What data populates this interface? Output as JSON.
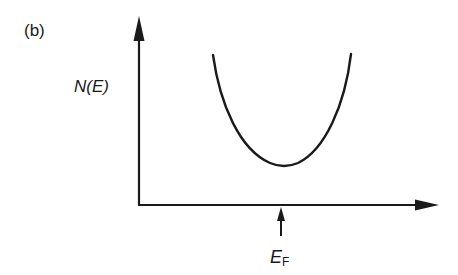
{
  "diagram": {
    "panel_label": "(b)",
    "y_axis_label": "N(E)",
    "x_marker_label_main": "E",
    "x_marker_label_sub": "F",
    "curve": "parabolic density of states with minimum at the Fermi energy",
    "line_color": "#1a1a1a"
  }
}
